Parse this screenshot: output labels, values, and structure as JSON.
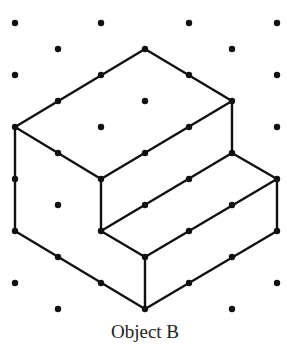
{
  "caption": "Object B",
  "colors": {
    "ink": "#111111",
    "background": "#ffffff"
  },
  "grid": {
    "type": "isometric-dot-grid",
    "columns_x": [
      15,
      58,
      101,
      145,
      189,
      232,
      277
    ],
    "rows_y": [
      23,
      49,
      75,
      101,
      127,
      153,
      179,
      205,
      231,
      257,
      283,
      309
    ]
  },
  "object": {
    "name": "Object B",
    "description": "Isometric drawing of a two-level stepped block",
    "vertices": [
      [
        145,
        49
      ],
      [
        232,
        101
      ],
      [
        15,
        127
      ],
      [
        101,
        179
      ],
      [
        232,
        153
      ],
      [
        277,
        179
      ],
      [
        101,
        231
      ],
      [
        145,
        257
      ],
      [
        277,
        231
      ],
      [
        15,
        231
      ],
      [
        145,
        309
      ]
    ],
    "edges": [
      [
        [
          145,
          49
        ],
        [
          232,
          101
        ]
      ],
      [
        [
          145,
          49
        ],
        [
          15,
          127
        ]
      ],
      [
        [
          15,
          127
        ],
        [
          101,
          179
        ]
      ],
      [
        [
          101,
          179
        ],
        [
          232,
          101
        ]
      ],
      [
        [
          232,
          101
        ],
        [
          232,
          153
        ]
      ],
      [
        [
          232,
          153
        ],
        [
          277,
          179
        ]
      ],
      [
        [
          232,
          153
        ],
        [
          101,
          231
        ]
      ],
      [
        [
          101,
          179
        ],
        [
          101,
          231
        ]
      ],
      [
        [
          101,
          231
        ],
        [
          145,
          257
        ]
      ],
      [
        [
          145,
          257
        ],
        [
          277,
          179
        ]
      ],
      [
        [
          277,
          179
        ],
        [
          277,
          231
        ]
      ],
      [
        [
          277,
          231
        ],
        [
          145,
          309
        ]
      ],
      [
        [
          15,
          127
        ],
        [
          15,
          231
        ]
      ],
      [
        [
          15,
          231
        ],
        [
          145,
          309
        ]
      ],
      [
        [
          145,
          257
        ],
        [
          145,
          309
        ]
      ]
    ]
  }
}
